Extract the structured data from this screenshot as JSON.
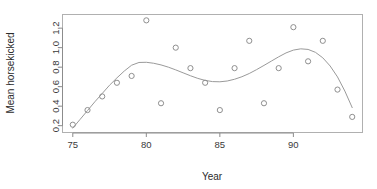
{
  "chart_data": {
    "type": "scatter",
    "title": "",
    "xlabel": "Year",
    "ylabel": "Mean horsekicked",
    "xlim": [
      74.3,
      94.7
    ],
    "ylim": [
      0.13,
      1.34
    ],
    "grid": false,
    "legend": "none",
    "xticks": [
      75,
      80,
      85,
      90
    ],
    "xtick_labels": [
      "75",
      "80",
      "85",
      "90"
    ],
    "yticks": [
      0.2,
      0.4,
      0.6,
      0.8,
      1.0,
      1.2
    ],
    "ytick_labels": [
      "0.2",
      "0.4",
      "0.6",
      "0.8",
      "1.0",
      "1.2"
    ],
    "x": [
      75,
      76,
      77,
      78,
      79,
      80,
      81,
      82,
      83,
      84,
      85,
      86,
      87,
      88,
      89,
      90,
      91,
      92,
      93,
      94
    ],
    "y": [
      0.21,
      0.36,
      0.5,
      0.64,
      0.71,
      1.28,
      0.43,
      1.0,
      0.79,
      0.64,
      0.36,
      0.79,
      1.07,
      0.43,
      0.79,
      1.21,
      0.86,
      1.07,
      0.57,
      0.29
    ],
    "marker": "open-circle",
    "marker_size": 2.6,
    "point_color": "#8f8f8f",
    "series": [
      {
        "name": "Mean horsekicked",
        "values": [
          0.21,
          0.36,
          0.5,
          0.64,
          0.71,
          1.28,
          0.43,
          1.0,
          0.79,
          0.64,
          0.36,
          0.79,
          1.07,
          0.43,
          0.79,
          1.21,
          0.86,
          1.07,
          0.57,
          0.29
        ]
      }
    ],
    "fit_curve": {
      "name": "smoothing-spline",
      "color": "#9a9a9a",
      "x": [
        75.0,
        75.5,
        76.0,
        76.5,
        77.0,
        77.5,
        78.0,
        78.5,
        79.0,
        79.5,
        80.0,
        80.5,
        81.0,
        81.5,
        82.0,
        82.5,
        83.0,
        83.5,
        84.0,
        84.5,
        85.0,
        85.5,
        86.0,
        86.5,
        87.0,
        87.5,
        88.0,
        88.5,
        89.0,
        89.5,
        90.0,
        90.5,
        91.0,
        91.5,
        92.0,
        92.5,
        93.0,
        93.5,
        94.0
      ],
      "y": [
        0.175,
        0.265,
        0.355,
        0.445,
        0.53,
        0.615,
        0.69,
        0.76,
        0.82,
        0.848,
        0.85,
        0.84,
        0.823,
        0.8,
        0.772,
        0.742,
        0.712,
        0.685,
        0.664,
        0.652,
        0.65,
        0.658,
        0.676,
        0.702,
        0.735,
        0.775,
        0.818,
        0.862,
        0.906,
        0.946,
        0.975,
        0.988,
        0.982,
        0.952,
        0.896,
        0.812,
        0.7,
        0.555,
        0.385
      ]
    }
  }
}
